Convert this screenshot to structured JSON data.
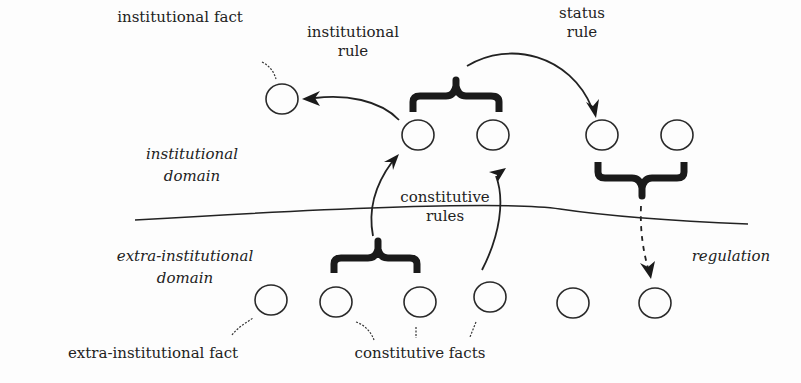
{
  "diagram": {
    "labels": {
      "institutional_fact": "institutional fact",
      "institutional_rule_1": "institutional",
      "institutional_rule_2": "rule",
      "status_rule_1": "status",
      "status_rule_2": "rule",
      "institutional_domain_1": "institutional",
      "institutional_domain_2": "domain",
      "constitutive_rules_1": "constitutive",
      "constitutive_rules_2": "rules",
      "extra_domain_1": "extra-institutional",
      "extra_domain_2": "domain",
      "regulation": "regulation",
      "extra_institutional_fact": "extra-institutional fact",
      "constitutive_facts": "constitutive facts"
    },
    "nodes": [
      {
        "id": "inst-fact",
        "cx": 282,
        "cy": 99
      },
      {
        "id": "inst-a",
        "cx": 418,
        "cy": 135
      },
      {
        "id": "inst-b",
        "cx": 493,
        "cy": 135
      },
      {
        "id": "status-a",
        "cx": 602,
        "cy": 135
      },
      {
        "id": "status-b",
        "cx": 677,
        "cy": 135
      },
      {
        "id": "extra-1",
        "cx": 271,
        "cy": 300
      },
      {
        "id": "extra-2",
        "cx": 336,
        "cy": 302
      },
      {
        "id": "extra-3",
        "cx": 420,
        "cy": 302
      },
      {
        "id": "extra-4",
        "cx": 490,
        "cy": 297
      },
      {
        "id": "extra-5",
        "cx": 573,
        "cy": 303
      },
      {
        "id": "extra-6",
        "cx": 655,
        "cy": 303
      }
    ]
  }
}
